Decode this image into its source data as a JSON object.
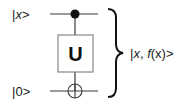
{
  "diagram": {
    "type": "quantum-circuit",
    "inputs": [
      {
        "label_prefix": "|",
        "label_var": "x",
        "label_suffix": ">",
        "role": "control"
      },
      {
        "label_prefix": "|",
        "label_var": "0",
        "label_suffix": ">",
        "role": "target"
      }
    ],
    "gate": {
      "label": "U"
    },
    "output": {
      "prefix": "|",
      "var1": "x",
      "sep": ", ",
      "func": "f",
      "arg": "(x)",
      "suffix": ">"
    },
    "colors": {
      "line": "#3a3a3a",
      "ink": "#111111",
      "box": "#888888"
    }
  }
}
